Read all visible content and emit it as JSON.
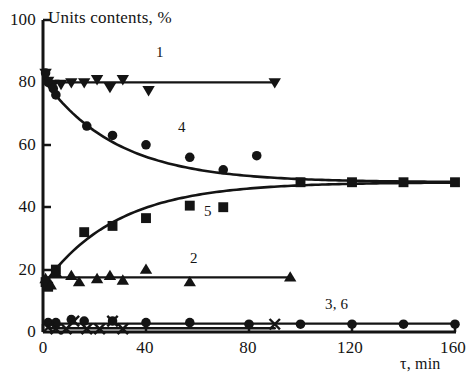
{
  "chart_data": {
    "type": "scatter",
    "title": "Units contents, %",
    "xlabel": "τ, min",
    "ylabel": "Units contents, %",
    "xlim": [
      0,
      160
    ],
    "ylim": [
      0,
      100
    ],
    "xticks": [
      0,
      40,
      80,
      120,
      160
    ],
    "yticks": [
      0,
      20,
      40,
      60,
      80,
      100
    ],
    "xtick_labels": [
      "0",
      "40",
      "80",
      "120",
      "160"
    ],
    "ytick_labels": [
      "0",
      "20",
      "40",
      "60",
      "80",
      "100"
    ],
    "grid": false,
    "legend": "inline-curve-numbers",
    "curve_labels": [
      {
        "text": "1",
        "x": 88,
        "y": 88
      },
      {
        "text": "4",
        "x": 93,
        "y": 65
      },
      {
        "text": "5",
        "x": 84,
        "y": 38
      },
      {
        "text": "2",
        "x": 73,
        "y": 23
      },
      {
        "text": "3, 6",
        "x": 116,
        "y": 9
      }
    ],
    "series": [
      {
        "name": "1",
        "marker": "triangle-down",
        "line": "flat",
        "points": [
          {
            "x": 1,
            "y": 83
          },
          {
            "x": 2,
            "y": 80.5
          },
          {
            "x": 4,
            "y": 79.5
          },
          {
            "x": 7,
            "y": 79.5
          },
          {
            "x": 11,
            "y": 80
          },
          {
            "x": 16,
            "y": 80
          },
          {
            "x": 21,
            "y": 81
          },
          {
            "x": 26,
            "y": 78.5
          },
          {
            "x": 31,
            "y": 81
          },
          {
            "x": 41,
            "y": 77.5
          },
          {
            "x": 90,
            "y": 80
          }
        ],
        "fit_value": 80
      },
      {
        "name": "4",
        "marker": "circle",
        "line": "exponential-decay",
        "points": [
          {
            "x": 1,
            "y": 83
          },
          {
            "x": 2,
            "y": 80
          },
          {
            "x": 4,
            "y": 78
          },
          {
            "x": 5,
            "y": 76
          },
          {
            "x": 17,
            "y": 66
          },
          {
            "x": 27,
            "y": 63
          },
          {
            "x": 40,
            "y": 60
          },
          {
            "x": 57,
            "y": 56
          },
          {
            "x": 70,
            "y": 52
          },
          {
            "x": 83,
            "y": 56.5
          }
        ],
        "fit_start": 80,
        "fit_end": 48
      },
      {
        "name": "5",
        "marker": "square",
        "line": "exponential-rise",
        "points": [
          {
            "x": 1,
            "y": 16
          },
          {
            "x": 2,
            "y": 14.5
          },
          {
            "x": 5,
            "y": 20
          },
          {
            "x": 16,
            "y": 32
          },
          {
            "x": 27,
            "y": 34
          },
          {
            "x": 40,
            "y": 36.5
          },
          {
            "x": 57,
            "y": 40.5
          },
          {
            "x": 70,
            "y": 40
          },
          {
            "x": 100,
            "y": 48
          },
          {
            "x": 120,
            "y": 48
          },
          {
            "x": 140,
            "y": 48
          },
          {
            "x": 160,
            "y": 48
          }
        ],
        "fit_start": 16,
        "fit_end": 48
      },
      {
        "name": "2",
        "marker": "triangle-up",
        "line": "flat",
        "points": [
          {
            "x": 1,
            "y": 17
          },
          {
            "x": 3,
            "y": 15
          },
          {
            "x": 5,
            "y": 19
          },
          {
            "x": 11,
            "y": 18
          },
          {
            "x": 14,
            "y": 16
          },
          {
            "x": 21,
            "y": 17
          },
          {
            "x": 26,
            "y": 18
          },
          {
            "x": 31,
            "y": 16.5
          },
          {
            "x": 40,
            "y": 20
          },
          {
            "x": 57,
            "y": 16
          },
          {
            "x": 96,
            "y": 17.5
          }
        ],
        "fit_value": 17.5
      },
      {
        "name": "3",
        "marker": "circle",
        "line": "flat",
        "points": [
          {
            "x": 2,
            "y": 3
          },
          {
            "x": 5,
            "y": 3
          },
          {
            "x": 11,
            "y": 4
          },
          {
            "x": 16,
            "y": 3.5
          },
          {
            "x": 27,
            "y": 3.5
          },
          {
            "x": 40,
            "y": 3
          },
          {
            "x": 57,
            "y": 3
          },
          {
            "x": 80,
            "y": 2.5
          },
          {
            "x": 100,
            "y": 2.5
          },
          {
            "x": 120,
            "y": 2.5
          },
          {
            "x": 140,
            "y": 2.5
          },
          {
            "x": 160,
            "y": 2.5
          }
        ],
        "fit_value": 2.7
      },
      {
        "name": "6",
        "marker": "x",
        "line": "flat",
        "points": [
          {
            "x": 2,
            "y": 1.5
          },
          {
            "x": 5,
            "y": 1
          },
          {
            "x": 9,
            "y": 1
          },
          {
            "x": 12,
            "y": 3.5
          },
          {
            "x": 17,
            "y": 1
          },
          {
            "x": 22,
            "y": 1
          },
          {
            "x": 27,
            "y": 3.5
          },
          {
            "x": 31,
            "y": 1
          },
          {
            "x": 90,
            "y": 2.5
          }
        ],
        "fit_value": 1.2
      }
    ],
    "colors": {
      "ink": "#141414",
      "background": "#ffffff"
    }
  },
  "axes": {
    "y_title": "Units contents, %",
    "x_title": "τ, min"
  }
}
